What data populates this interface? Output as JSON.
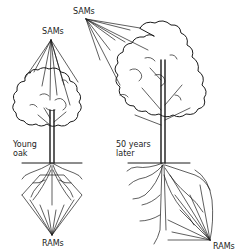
{
  "diagram": {
    "trees": [
      {
        "id": "young-oak",
        "label": "Young\noak",
        "top_label": "SAMs",
        "bottom_label": "RAMs"
      },
      {
        "id": "oak-50-years",
        "label": "50 years\nlater",
        "top_label": "SAMs",
        "bottom_label": "RAMs"
      }
    ],
    "colors": {
      "ink": "#1a1a1a",
      "background": "#ffffff"
    }
  }
}
